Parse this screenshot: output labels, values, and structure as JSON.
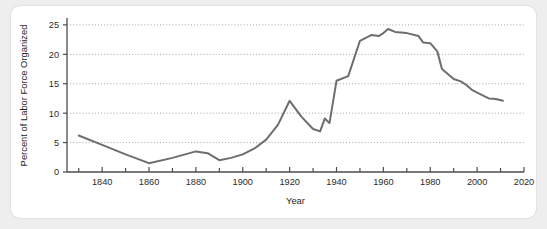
{
  "card": {
    "background_color": "#ffffff",
    "page_background_color": "#eeeeee"
  },
  "chart_data": {
    "type": "line",
    "title": "",
    "xlabel": "Year",
    "ylabel": "Percent of Labor Force Organized",
    "xlim": [
      1825,
      2020
    ],
    "ylim": [
      0,
      26
    ],
    "grid": true,
    "grid_axis": "y",
    "legend": false,
    "legend_position": "none",
    "line_color": "#6e6e6e",
    "x_ticks_major": [
      1840,
      1860,
      1880,
      1900,
      1920,
      1940,
      1960,
      1980,
      2000,
      2020
    ],
    "x_tick_labels": [
      "1840",
      "1860",
      "1880",
      "1900",
      "1920",
      "1940",
      "1960",
      "1980",
      "2000",
      "2020"
    ],
    "x_ticks_minor": [
      1830,
      1850,
      1870,
      1890,
      1910,
      1930,
      1950,
      1970,
      1990,
      2010
    ],
    "y_ticks": [
      0,
      5,
      10,
      15,
      20,
      25
    ],
    "y_tick_labels": [
      "0",
      "5",
      "10",
      "15",
      "20",
      "25"
    ],
    "series": [
      {
        "name": "Percent of Labor Force Organized",
        "x": [
          1830,
          1840,
          1850,
          1860,
          1870,
          1880,
          1885,
          1890,
          1895,
          1900,
          1905,
          1910,
          1915,
          1920,
          1925,
          1930,
          1933,
          1935,
          1937,
          1940,
          1945,
          1950,
          1955,
          1958,
          1960,
          1962,
          1965,
          1970,
          1975,
          1977,
          1980,
          1983,
          1985,
          1988,
          1990,
          1993,
          1995,
          1998,
          2000,
          2003,
          2005,
          2008,
          2011
        ],
        "values": [
          6.2,
          4.6,
          3.0,
          1.5,
          2.4,
          3.5,
          3.2,
          2.0,
          2.4,
          3.0,
          4.0,
          5.5,
          8.0,
          12.1,
          9.4,
          7.3,
          6.9,
          9.1,
          8.3,
          15.5,
          16.3,
          22.3,
          23.3,
          23.1,
          23.6,
          24.3,
          23.8,
          23.6,
          23.1,
          22.0,
          21.9,
          20.5,
          17.5,
          16.5,
          15.8,
          15.4,
          14.9,
          13.9,
          13.5,
          12.9,
          12.5,
          12.4,
          12.1
        ]
      }
    ]
  }
}
